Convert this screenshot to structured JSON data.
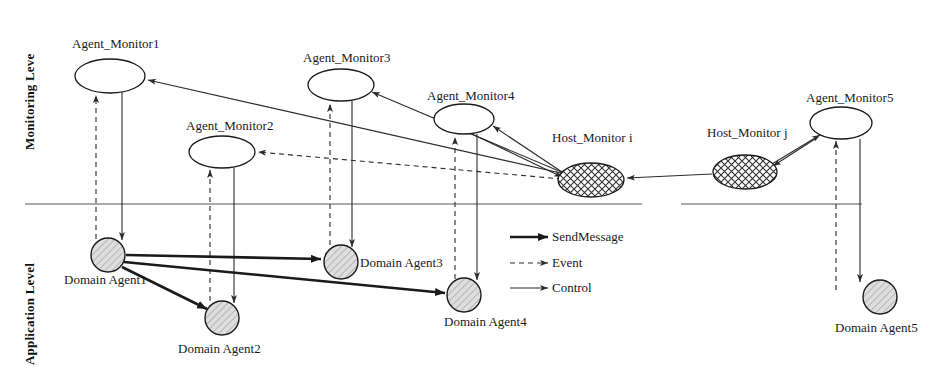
{
  "diagram": {
    "levels": [
      {
        "id": "monitoring",
        "label": "Monitoring Leve"
      },
      {
        "id": "application",
        "label": "Application Level"
      }
    ],
    "monitor_nodes": [
      {
        "id": "am1",
        "label": "Agent_Monitor1",
        "cx": 110,
        "cy": 76,
        "rx": 35,
        "ry": 17,
        "fill": "none",
        "label_x": 72,
        "label_y": 36
      },
      {
        "id": "am2",
        "label": "Agent_Monitor2",
        "cx": 222,
        "cy": 152,
        "rx": 33,
        "ry": 16,
        "fill": "none",
        "label_x": 186,
        "label_y": 118
      },
      {
        "id": "am3",
        "label": "Agent_Monitor3",
        "cx": 341,
        "cy": 85,
        "rx": 33,
        "ry": 16,
        "fill": "none",
        "label_x": 303,
        "label_y": 50
      },
      {
        "id": "am4",
        "label": "Agent_Monitor4",
        "cx": 464,
        "cy": 119,
        "rx": 30,
        "ry": 15,
        "fill": "none",
        "label_x": 427,
        "label_y": 88
      },
      {
        "id": "am5",
        "label": "Agent_Monitor5",
        "cx": 841,
        "cy": 123,
        "rx": 31,
        "ry": 16,
        "fill": "none",
        "label_x": 806,
        "label_y": 90
      },
      {
        "id": "hmi",
        "label": "Host_Monitor i",
        "cx": 591,
        "cy": 180,
        "rx": 33,
        "ry": 17,
        "fill": "hatch",
        "label_x": 552,
        "label_y": 130
      },
      {
        "id": "hmj",
        "label": "Host_Monitor j",
        "cx": 745,
        "cy": 172,
        "rx": 32,
        "ry": 17,
        "fill": "hatch",
        "label_x": 707,
        "label_y": 125
      }
    ],
    "agent_nodes": [
      {
        "id": "da1",
        "label": "Domain Agent1",
        "cx": 108,
        "cy": 255,
        "r": 17,
        "label_x": 64,
        "label_y": 272
      },
      {
        "id": "da2",
        "label": "Domain Agent2",
        "cx": 222,
        "cy": 318,
        "r": 17,
        "label_x": 178,
        "label_y": 341
      },
      {
        "id": "da3",
        "label": "Domain Agent3",
        "cx": 341,
        "cy": 262,
        "r": 17,
        "label_x": 360,
        "label_y": 255
      },
      {
        "id": "da4",
        "label": "Domain Agent4",
        "cx": 464,
        "cy": 295,
        "r": 17,
        "label_x": 444,
        "label_y": 314
      },
      {
        "id": "da5",
        "label": "Domain Agent5",
        "cx": 880,
        "cy": 297,
        "r": 17,
        "label_x": 835,
        "label_y": 320
      }
    ],
    "level_dividers": [
      {
        "id": "divider-left",
        "x1": 25,
        "y1": 204,
        "x2": 642,
        "y2": 204
      },
      {
        "id": "divider-right",
        "x1": 681,
        "y1": 204,
        "x2": 862,
        "y2": 204
      }
    ],
    "edges": [
      {
        "id": "e-da1-am1-event",
        "kind": "event",
        "x1": 96,
        "y1": 248,
        "x2": 96,
        "y2": 95
      },
      {
        "id": "e-am1-da1-control",
        "kind": "control",
        "x1": 122,
        "y1": 92,
        "x2": 122,
        "y2": 240
      },
      {
        "id": "e-da2-am2-event",
        "kind": "event",
        "x1": 210,
        "y1": 310,
        "x2": 210,
        "y2": 170
      },
      {
        "id": "e-am2-da2-control",
        "kind": "control",
        "x1": 234,
        "y1": 168,
        "x2": 234,
        "y2": 303
      },
      {
        "id": "e-da3-am3-event",
        "kind": "event",
        "x1": 330,
        "y1": 254,
        "x2": 330,
        "y2": 104
      },
      {
        "id": "e-am3-da3-control",
        "kind": "control",
        "x1": 352,
        "y1": 101,
        "x2": 352,
        "y2": 247
      },
      {
        "id": "e-da4-am4-event",
        "kind": "event",
        "x1": 455,
        "y1": 288,
        "x2": 455,
        "y2": 137
      },
      {
        "id": "e-am4-da4-control",
        "kind": "control",
        "x1": 477,
        "y1": 134,
        "x2": 477,
        "y2": 280
      },
      {
        "id": "e-da5-am5-event",
        "kind": "event",
        "x1": 836,
        "y1": 290,
        "x2": 836,
        "y2": 141
      },
      {
        "id": "e-am5-da5-control",
        "kind": "control",
        "x1": 860,
        "y1": 139,
        "x2": 860,
        "y2": 282
      },
      {
        "id": "e-hmi-am1-control",
        "kind": "control",
        "x1": 565,
        "y1": 174,
        "x2": 148,
        "y2": 80
      },
      {
        "id": "e-hmi-am2-event",
        "kind": "event",
        "x1": 562,
        "y1": 179,
        "x2": 258,
        "y2": 152
      },
      {
        "id": "e-hmi-am3-control",
        "kind": "control",
        "x1": 566,
        "y1": 174,
        "x2": 372,
        "y2": 92
      },
      {
        "id": "e-hmi-am4-control",
        "kind": "control",
        "x1": 568,
        "y1": 176,
        "x2": 493,
        "y2": 126
      },
      {
        "id": "e-am4-hmi-control",
        "kind": "control",
        "x1": 472,
        "y1": 134,
        "x2": 562,
        "y2": 177
      },
      {
        "id": "e-hmj-hmi-control",
        "kind": "control",
        "x1": 712,
        "y1": 174,
        "x2": 627,
        "y2": 178
      },
      {
        "id": "e-hmj-am5-control",
        "kind": "control",
        "x1": 772,
        "y1": 164,
        "x2": 820,
        "y2": 135
      },
      {
        "id": "e-am5-hmj-control",
        "kind": "control",
        "x1": 818,
        "y1": 137,
        "x2": 773,
        "y2": 166
      },
      {
        "id": "e-da1-da3-message",
        "kind": "message",
        "x1": 126,
        "y1": 255,
        "x2": 321,
        "y2": 259
      },
      {
        "id": "e-da1-da4-message",
        "kind": "message",
        "x1": 124,
        "y1": 262,
        "x2": 445,
        "y2": 293
      },
      {
        "id": "e-da1-da2-message",
        "kind": "message",
        "x1": 122,
        "y1": 267,
        "x2": 207,
        "y2": 309
      }
    ],
    "legend": {
      "items": [
        {
          "id": "legend-sendmessage",
          "label": "SendMessage",
          "kind": "message",
          "x1": 510,
          "y1": 237,
          "x2": 548,
          "y2": 237,
          "label_x": 552,
          "label_y": 229
        },
        {
          "id": "legend-event",
          "label": "Event",
          "kind": "event",
          "x1": 510,
          "y1": 263,
          "x2": 548,
          "y2": 263,
          "label_x": 552,
          "label_y": 255
        },
        {
          "id": "legend-control",
          "label": "Control",
          "kind": "control",
          "x1": 510,
          "y1": 288,
          "x2": 548,
          "y2": 288,
          "label_x": 552,
          "label_y": 280
        }
      ]
    },
    "colors": {
      "ink": "#1a1a1a",
      "line": "#2b2b2b",
      "divider": "#555555",
      "agent_fill": "#d8d8d8",
      "host_fill": "#ffffff"
    }
  }
}
